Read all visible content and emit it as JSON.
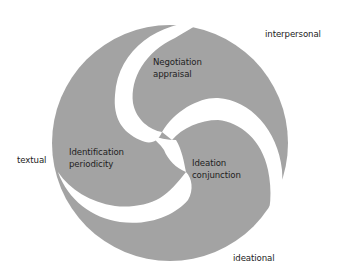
{
  "diagram": {
    "type": "triskelion-circle",
    "colors": {
      "fill": "#a3a3a3",
      "gap": "#ffffff",
      "text": "#222222"
    },
    "outer_labels": {
      "top_right": "interpersonal",
      "left": "textual",
      "bottom": "ideational"
    },
    "lobes": {
      "top": {
        "line1": "Negotiation",
        "line2": "appraisal"
      },
      "left": {
        "line1": "Identification",
        "line2": "periodicity"
      },
      "right": {
        "line1": "Ideation",
        "line2": "conjunction"
      }
    }
  }
}
